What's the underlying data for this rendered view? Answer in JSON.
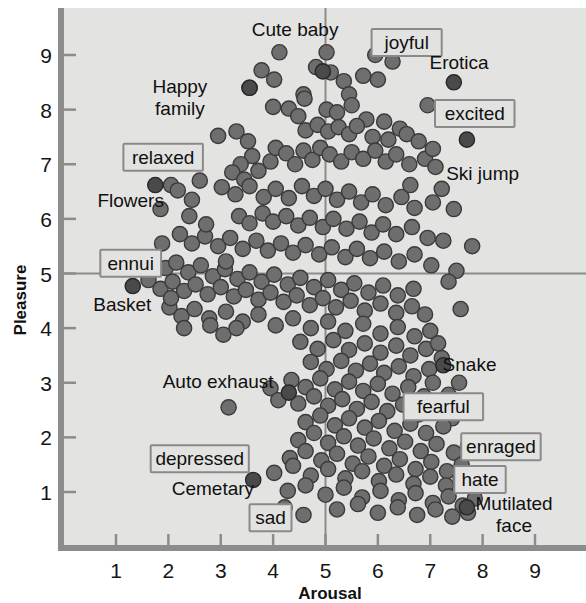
{
  "chart_data": {
    "type": "scatter",
    "title": "",
    "xlabel": "Arousal",
    "ylabel": "Pleasure",
    "xlim": [
      0.4,
      9.6
    ],
    "ylim": [
      0.25,
      9.55
    ],
    "xticks": [
      1,
      2,
      3,
      4,
      5,
      6,
      7,
      8,
      9
    ],
    "yticks": [
      1,
      2,
      3,
      4,
      5,
      6,
      7,
      8,
      9
    ],
    "grid": false,
    "reference_lines": {
      "x": 5,
      "y": 5
    },
    "marker_color": "#6e6e6e",
    "marker_edge_color": "#3a3a3a",
    "highlight_marker_color": "#4a4a4a",
    "plot_background": "#e3e3e1",
    "axis_color": "#8c8c8c",
    "annotations": [
      {
        "text": "Cute baby",
        "type": "picture",
        "x": 4.42,
        "y": 9.45,
        "boxed": false
      },
      {
        "text": "joyful",
        "type": "term",
        "x": 6.55,
        "y": 9.22,
        "boxed": true
      },
      {
        "text": "Erotica",
        "type": "picture",
        "x": 7.55,
        "y": 8.85,
        "boxed": false
      },
      {
        "text": "Happy family",
        "type": "picture",
        "x": 2.22,
        "y": 8.42,
        "boxed": false
      },
      {
        "text": "excited",
        "type": "term",
        "x": 7.85,
        "y": 7.92,
        "boxed": true
      },
      {
        "text": "Ski jump",
        "type": "picture",
        "x": 8.0,
        "y": 6.82,
        "boxed": false
      },
      {
        "text": "relaxed",
        "type": "term",
        "x": 1.9,
        "y": 7.12,
        "boxed": true
      },
      {
        "text": "Flowers",
        "type": "picture",
        "x": 1.28,
        "y": 6.32,
        "boxed": false
      },
      {
        "text": "ennui",
        "type": "term",
        "x": 1.28,
        "y": 5.18,
        "boxed": true
      },
      {
        "text": "Basket",
        "type": "picture",
        "x": 1.12,
        "y": 4.42,
        "boxed": false
      },
      {
        "text": "Snake",
        "type": "picture",
        "x": 7.75,
        "y": 3.32,
        "boxed": false
      },
      {
        "text": "Auto exhaust",
        "type": "picture",
        "x": 2.95,
        "y": 3.02,
        "boxed": false
      },
      {
        "text": "fearful",
        "type": "term",
        "x": 7.25,
        "y": 2.55,
        "boxed": true
      },
      {
        "text": "enraged",
        "type": "term",
        "x": 8.35,
        "y": 1.82,
        "boxed": true
      },
      {
        "text": "depressed",
        "type": "term",
        "x": 2.6,
        "y": 1.6,
        "boxed": true
      },
      {
        "text": "hate",
        "type": "term",
        "x": 7.95,
        "y": 1.22,
        "boxed": true
      },
      {
        "text": "Cemetary",
        "type": "picture",
        "x": 2.85,
        "y": 1.05,
        "boxed": false
      },
      {
        "text": "Mutilated face",
        "type": "picture",
        "x": 8.6,
        "y": 0.78,
        "boxed": false
      },
      {
        "text": "sad",
        "type": "term",
        "x": 3.95,
        "y": 0.52,
        "boxed": true
      }
    ],
    "highlight_points": [
      {
        "name": "Cute baby",
        "x": 4.95,
        "y": 8.7
      },
      {
        "name": "Erotica",
        "x": 7.45,
        "y": 8.5
      },
      {
        "name": "Ski jump",
        "x": 7.7,
        "y": 7.45
      },
      {
        "name": "Happy family",
        "x": 3.55,
        "y": 8.4
      },
      {
        "name": "Flowers",
        "x": 1.75,
        "y": 6.62
      },
      {
        "name": "Basket",
        "x": 1.32,
        "y": 4.77
      },
      {
        "name": "Snake",
        "x": 7.25,
        "y": 3.32
      },
      {
        "name": "Auto exhaust",
        "x": 4.3,
        "y": 2.82
      },
      {
        "name": "Cemetary",
        "x": 3.62,
        "y": 1.22
      },
      {
        "name": "Mutilated face",
        "x": 7.7,
        "y": 0.72
      }
    ],
    "points": [
      [
        4.12,
        9.05
      ],
      [
        5.02,
        9.05
      ],
      [
        3.78,
        8.72
      ],
      [
        4.02,
        8.55
      ],
      [
        4.82,
        8.78
      ],
      [
        5.1,
        8.68
      ],
      [
        5.35,
        8.52
      ],
      [
        4.58,
        8.28
      ],
      [
        5.45,
        8.28
      ],
      [
        5.72,
        8.62
      ],
      [
        6.0,
        8.55
      ],
      [
        3.55,
        8.4
      ],
      [
        4.0,
        8.05
      ],
      [
        4.3,
        8.02
      ],
      [
        4.48,
        7.88
      ],
      [
        4.6,
        8.2
      ],
      [
        5.02,
        8.0
      ],
      [
        5.22,
        7.95
      ],
      [
        5.5,
        8.08
      ],
      [
        5.78,
        7.82
      ],
      [
        6.12,
        7.78
      ],
      [
        6.42,
        7.65
      ],
      [
        4.62,
        7.62
      ],
      [
        4.85,
        7.72
      ],
      [
        5.05,
        7.6
      ],
      [
        5.25,
        7.68
      ],
      [
        5.45,
        7.55
      ],
      [
        5.6,
        7.7
      ],
      [
        5.9,
        7.5
      ],
      [
        6.2,
        7.45
      ],
      [
        6.55,
        7.55
      ],
      [
        6.78,
        7.42
      ],
      [
        2.95,
        7.52
      ],
      [
        3.3,
        7.6
      ],
      [
        3.52,
        7.42
      ],
      [
        3.6,
        7.15
      ],
      [
        3.38,
        7.0
      ],
      [
        3.22,
        6.85
      ],
      [
        3.45,
        6.72
      ],
      [
        3.72,
        6.88
      ],
      [
        3.95,
        7.05
      ],
      [
        4.05,
        7.3
      ],
      [
        4.25,
        7.2
      ],
      [
        4.42,
        7.0
      ],
      [
        4.58,
        7.25
      ],
      [
        4.75,
        7.08
      ],
      [
        4.9,
        7.3
      ],
      [
        5.08,
        7.18
      ],
      [
        5.3,
        7.05
      ],
      [
        5.5,
        7.22
      ],
      [
        5.72,
        7.1
      ],
      [
        5.95,
        7.25
      ],
      [
        6.15,
        7.05
      ],
      [
        6.35,
        7.18
      ],
      [
        6.6,
        7.0
      ],
      [
        6.9,
        7.1
      ],
      [
        7.1,
        6.95
      ],
      [
        2.05,
        6.62
      ],
      [
        2.18,
        6.52
      ],
      [
        2.45,
        6.35
      ],
      [
        1.85,
        6.18
      ],
      [
        2.6,
        6.7
      ],
      [
        3.02,
        6.58
      ],
      [
        3.28,
        6.45
      ],
      [
        3.55,
        6.6
      ],
      [
        3.82,
        6.4
      ],
      [
        4.05,
        6.55
      ],
      [
        4.3,
        6.38
      ],
      [
        4.55,
        6.6
      ],
      [
        4.78,
        6.42
      ],
      [
        5.0,
        6.55
      ],
      [
        5.22,
        6.35
      ],
      [
        5.45,
        6.5
      ],
      [
        5.68,
        6.3
      ],
      [
        5.9,
        6.45
      ],
      [
        6.15,
        6.25
      ],
      [
        6.45,
        6.4
      ],
      [
        6.7,
        6.2
      ],
      [
        7.05,
        6.3
      ],
      [
        7.45,
        6.18
      ],
      [
        3.35,
        6.05
      ],
      [
        3.55,
        5.92
      ],
      [
        3.8,
        6.1
      ],
      [
        4.0,
        5.95
      ],
      [
        4.25,
        6.05
      ],
      [
        4.48,
        5.88
      ],
      [
        4.7,
        6.02
      ],
      [
        4.95,
        5.85
      ],
      [
        5.15,
        6.0
      ],
      [
        5.4,
        5.82
      ],
      [
        5.65,
        5.95
      ],
      [
        5.88,
        5.75
      ],
      [
        6.1,
        5.9
      ],
      [
        6.35,
        5.72
      ],
      [
        6.65,
        5.85
      ],
      [
        6.95,
        5.65
      ],
      [
        7.25,
        5.6
      ],
      [
        2.22,
        5.72
      ],
      [
        2.45,
        5.55
      ],
      [
        2.7,
        5.68
      ],
      [
        2.95,
        5.5
      ],
      [
        3.18,
        5.65
      ],
      [
        3.42,
        5.45
      ],
      [
        3.68,
        5.6
      ],
      [
        3.9,
        5.42
      ],
      [
        4.15,
        5.55
      ],
      [
        4.38,
        5.38
      ],
      [
        4.62,
        5.52
      ],
      [
        4.88,
        5.35
      ],
      [
        5.12,
        5.48
      ],
      [
        5.38,
        5.3
      ],
      [
        5.6,
        5.45
      ],
      [
        5.85,
        5.28
      ],
      [
        6.12,
        5.4
      ],
      [
        6.4,
        5.22
      ],
      [
        6.7,
        5.35
      ],
      [
        7.02,
        5.15
      ],
      [
        7.5,
        5.05
      ],
      [
        1.72,
        5.28
      ],
      [
        1.95,
        5.1
      ],
      [
        2.15,
        5.2
      ],
      [
        2.38,
        5.02
      ],
      [
        2.62,
        5.15
      ],
      [
        2.85,
        4.95
      ],
      [
        3.08,
        5.08
      ],
      [
        3.32,
        4.9
      ],
      [
        3.55,
        5.02
      ],
      [
        3.78,
        4.85
      ],
      [
        4.02,
        4.98
      ],
      [
        4.28,
        4.8
      ],
      [
        4.52,
        4.92
      ],
      [
        4.78,
        4.75
      ],
      [
        5.05,
        4.88
      ],
      [
        5.3,
        4.7
      ],
      [
        5.55,
        4.82
      ],
      [
        5.82,
        4.65
      ],
      [
        6.1,
        4.78
      ],
      [
        6.38,
        4.6
      ],
      [
        6.68,
        4.72
      ],
      [
        1.62,
        4.88
      ],
      [
        1.85,
        4.72
      ],
      [
        2.08,
        4.85
      ],
      [
        2.3,
        4.68
      ],
      [
        2.52,
        4.8
      ],
      [
        2.75,
        4.62
      ],
      [
        3.0,
        4.75
      ],
      [
        3.25,
        4.58
      ],
      [
        3.48,
        4.7
      ],
      [
        3.72,
        4.52
      ],
      [
        3.95,
        4.65
      ],
      [
        4.2,
        4.48
      ],
      [
        4.45,
        4.6
      ],
      [
        4.7,
        4.42
      ],
      [
        4.95,
        4.55
      ],
      [
        5.2,
        4.38
      ],
      [
        5.48,
        4.5
      ],
      [
        5.75,
        4.32
      ],
      [
        6.05,
        4.45
      ],
      [
        6.35,
        4.28
      ],
      [
        6.65,
        4.4
      ],
      [
        2.02,
        4.38
      ],
      [
        2.25,
        4.22
      ],
      [
        2.5,
        4.35
      ],
      [
        2.78,
        4.18
      ],
      [
        3.1,
        4.3
      ],
      [
        3.42,
        4.12
      ],
      [
        3.72,
        4.25
      ],
      [
        4.05,
        4.05
      ],
      [
        4.38,
        4.18
      ],
      [
        4.72,
        4.0
      ],
      [
        5.05,
        4.12
      ],
      [
        5.38,
        3.95
      ],
      [
        5.72,
        4.08
      ],
      [
        6.05,
        3.9
      ],
      [
        6.38,
        4.02
      ],
      [
        6.7,
        3.85
      ],
      [
        7.0,
        3.95
      ],
      [
        4.52,
        3.75
      ],
      [
        4.85,
        3.62
      ],
      [
        5.15,
        3.78
      ],
      [
        5.45,
        3.6
      ],
      [
        5.75,
        3.72
      ],
      [
        6.05,
        3.55
      ],
      [
        6.35,
        3.68
      ],
      [
        6.62,
        3.5
      ],
      [
        6.92,
        3.62
      ],
      [
        7.22,
        3.45
      ],
      [
        4.72,
        3.38
      ],
      [
        5.02,
        3.25
      ],
      [
        5.3,
        3.4
      ],
      [
        5.58,
        3.22
      ],
      [
        5.85,
        3.35
      ],
      [
        6.12,
        3.18
      ],
      [
        6.4,
        3.3
      ],
      [
        6.68,
        3.12
      ],
      [
        6.98,
        3.25
      ],
      [
        7.05,
        3.0
      ],
      [
        4.35,
        3.05
      ],
      [
        4.62,
        2.92
      ],
      [
        4.9,
        3.08
      ],
      [
        5.18,
        2.88
      ],
      [
        5.45,
        3.02
      ],
      [
        5.72,
        2.85
      ],
      [
        6.0,
        2.98
      ],
      [
        6.28,
        2.8
      ],
      [
        6.58,
        2.92
      ],
      [
        6.88,
        2.75
      ],
      [
        4.48,
        2.62
      ],
      [
        4.78,
        2.75
      ],
      [
        5.05,
        2.58
      ],
      [
        5.32,
        2.7
      ],
      [
        5.6,
        2.52
      ],
      [
        5.88,
        2.65
      ],
      [
        6.18,
        2.48
      ],
      [
        6.48,
        2.6
      ],
      [
        6.78,
        2.42
      ],
      [
        7.1,
        2.55
      ],
      [
        7.42,
        2.35
      ],
      [
        4.62,
        2.28
      ],
      [
        4.9,
        2.4
      ],
      [
        5.18,
        2.22
      ],
      [
        5.45,
        2.35
      ],
      [
        5.75,
        2.18
      ],
      [
        6.02,
        2.3
      ],
      [
        6.32,
        2.12
      ],
      [
        6.62,
        2.25
      ],
      [
        6.92,
        2.08
      ],
      [
        7.25,
        2.2
      ],
      [
        4.48,
        1.95
      ],
      [
        4.78,
        2.08
      ],
      [
        5.05,
        1.9
      ],
      [
        5.35,
        2.02
      ],
      [
        5.62,
        1.85
      ],
      [
        5.92,
        1.98
      ],
      [
        6.22,
        1.8
      ],
      [
        6.52,
        1.92
      ],
      [
        6.82,
        1.75
      ],
      [
        7.12,
        1.88
      ],
      [
        7.45,
        1.72
      ],
      [
        7.72,
        1.85
      ],
      [
        4.32,
        1.62
      ],
      [
        4.62,
        1.75
      ],
      [
        4.92,
        1.58
      ],
      [
        5.22,
        1.7
      ],
      [
        5.52,
        1.52
      ],
      [
        5.82,
        1.65
      ],
      [
        6.12,
        1.48
      ],
      [
        6.42,
        1.6
      ],
      [
        6.72,
        1.42
      ],
      [
        7.02,
        1.55
      ],
      [
        7.32,
        1.38
      ],
      [
        7.6,
        1.5
      ],
      [
        4.02,
        1.35
      ],
      [
        4.38,
        1.48
      ],
      [
        4.72,
        1.3
      ],
      [
        5.05,
        1.42
      ],
      [
        5.38,
        1.25
      ],
      [
        5.7,
        1.38
      ],
      [
        6.02,
        1.2
      ],
      [
        6.35,
        1.32
      ],
      [
        6.68,
        1.15
      ],
      [
        7.0,
        1.28
      ],
      [
        7.3,
        1.12
      ],
      [
        7.58,
        1.25
      ],
      [
        4.28,
        1.02
      ],
      [
        4.62,
        1.12
      ],
      [
        5.0,
        0.95
      ],
      [
        5.35,
        1.08
      ],
      [
        5.7,
        0.9
      ],
      [
        6.05,
        1.02
      ],
      [
        6.4,
        0.85
      ],
      [
        6.72,
        0.98
      ],
      [
        7.05,
        0.8
      ],
      [
        7.35,
        0.92
      ],
      [
        7.62,
        0.75
      ],
      [
        7.85,
        0.88
      ],
      [
        5.22,
        0.68
      ],
      [
        5.62,
        0.78
      ],
      [
        6.0,
        0.62
      ],
      [
        6.38,
        0.72
      ],
      [
        6.75,
        0.58
      ],
      [
        7.1,
        0.68
      ],
      [
        7.42,
        0.55
      ],
      [
        7.72,
        0.62
      ],
      [
        2.8,
        4.05
      ],
      [
        3.05,
        3.88
      ],
      [
        3.3,
        4.0
      ],
      [
        3.15,
        2.55
      ],
      [
        3.95,
        2.9
      ],
      [
        4.1,
        2.68
      ],
      [
        7.55,
        3.0
      ],
      [
        7.35,
        2.78
      ],
      [
        7.8,
        5.5
      ],
      [
        7.22,
        6.55
      ],
      [
        7.05,
        7.28
      ],
      [
        6.95,
        8.08
      ],
      [
        6.28,
        8.88
      ],
      [
        5.95,
        9.0
      ],
      [
        3.1,
        5.22
      ],
      [
        2.72,
        5.9
      ],
      [
        2.4,
        6.05
      ],
      [
        1.88,
        5.55
      ],
      [
        2.05,
        4.55
      ],
      [
        2.3,
        4.0
      ],
      [
        6.62,
        6.62
      ],
      [
        7.35,
        4.85
      ],
      [
        7.58,
        4.35
      ],
      [
        6.9,
        4.25
      ],
      [
        7.15,
        3.72
      ],
      [
        4.22,
        0.72
      ],
      [
        4.58,
        0.58
      ]
    ]
  },
  "labels": {
    "xlabel": "Arousal",
    "ylabel": "Pleasure"
  }
}
